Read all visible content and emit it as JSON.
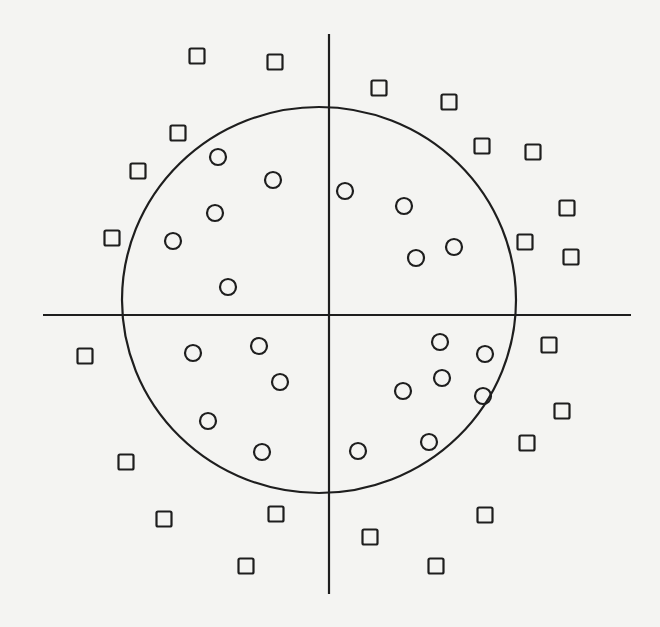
{
  "diagram": {
    "width": 660,
    "height": 627,
    "background": "#f4f4f2",
    "stroke_color": "#1e1e1e",
    "axes": {
      "horizontal": {
        "x1": 43,
        "x2": 631,
        "y": 315,
        "stroke_width": 2.2
      },
      "vertical": {
        "x": 329,
        "y1": 34,
        "y2": 594,
        "stroke_width": 2.2
      }
    },
    "boundary_circle": {
      "cx": 319,
      "cy": 300,
      "rx": 197,
      "ry": 193,
      "stroke_width": 2.2
    },
    "marker_size": {
      "square_side": 15,
      "circle_radius": 8,
      "stroke_width": 2.2
    },
    "squares": [
      {
        "x": 197,
        "y": 56
      },
      {
        "x": 275,
        "y": 62
      },
      {
        "x": 379,
        "y": 88
      },
      {
        "x": 449,
        "y": 102
      },
      {
        "x": 178,
        "y": 133
      },
      {
        "x": 482,
        "y": 146
      },
      {
        "x": 533,
        "y": 152
      },
      {
        "x": 138,
        "y": 171
      },
      {
        "x": 567,
        "y": 208
      },
      {
        "x": 112,
        "y": 238
      },
      {
        "x": 525,
        "y": 242
      },
      {
        "x": 571,
        "y": 257
      },
      {
        "x": 85,
        "y": 356
      },
      {
        "x": 549,
        "y": 345
      },
      {
        "x": 562,
        "y": 411
      },
      {
        "x": 527,
        "y": 443
      },
      {
        "x": 126,
        "y": 462
      },
      {
        "x": 164,
        "y": 519
      },
      {
        "x": 276,
        "y": 514
      },
      {
        "x": 485,
        "y": 515
      },
      {
        "x": 370,
        "y": 537
      },
      {
        "x": 246,
        "y": 566
      },
      {
        "x": 436,
        "y": 566
      }
    ],
    "circles": [
      {
        "x": 218,
        "y": 157
      },
      {
        "x": 273,
        "y": 180
      },
      {
        "x": 345,
        "y": 191
      },
      {
        "x": 404,
        "y": 206
      },
      {
        "x": 215,
        "y": 213
      },
      {
        "x": 173,
        "y": 241
      },
      {
        "x": 454,
        "y": 247
      },
      {
        "x": 416,
        "y": 258
      },
      {
        "x": 228,
        "y": 287
      },
      {
        "x": 193,
        "y": 353
      },
      {
        "x": 259,
        "y": 346
      },
      {
        "x": 280,
        "y": 382
      },
      {
        "x": 208,
        "y": 421
      },
      {
        "x": 262,
        "y": 452
      },
      {
        "x": 440,
        "y": 342
      },
      {
        "x": 485,
        "y": 354
      },
      {
        "x": 442,
        "y": 378
      },
      {
        "x": 403,
        "y": 391
      },
      {
        "x": 483,
        "y": 396
      },
      {
        "x": 429,
        "y": 442
      },
      {
        "x": 358,
        "y": 451
      }
    ]
  }
}
